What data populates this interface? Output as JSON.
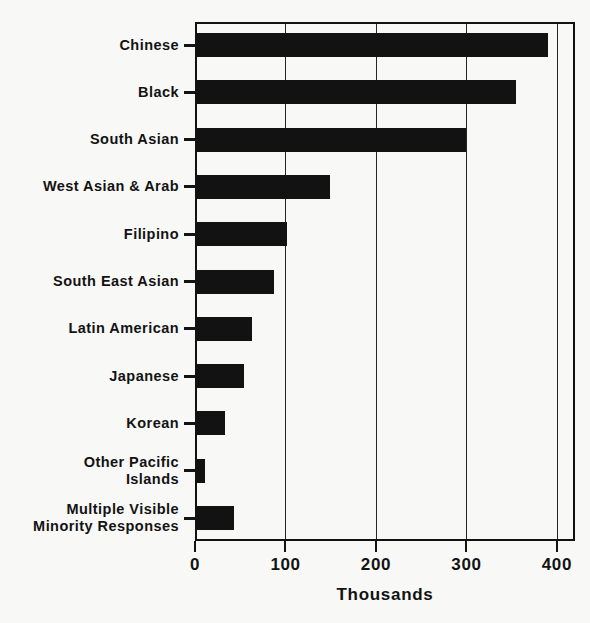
{
  "chart_data": {
    "type": "bar",
    "orientation": "horizontal",
    "title": "",
    "subtitle": "",
    "xlabel": "Thousands",
    "ylabel": "",
    "xlim": [
      0,
      420
    ],
    "xticks": [
      0,
      100,
      200,
      300,
      400
    ],
    "xticklabels": [
      "0",
      "100",
      "200",
      "300",
      "400"
    ],
    "grid": "vertical",
    "legend": "none",
    "categories": [
      "Chinese",
      "Black",
      "South Asian",
      "West Asian & Arab",
      "Filipino",
      "South East Asian",
      "Latin American",
      "Japanese",
      "Korean",
      "Other Pacific\nIslands",
      "Multiple Visible\nMinority Responses"
    ],
    "values": [
      390,
      355,
      300,
      149,
      102,
      87,
      63,
      54,
      33,
      11,
      43
    ],
    "bar_color": "#121212",
    "axis_color": "#131313",
    "background_color": "#f8f8f6"
  }
}
